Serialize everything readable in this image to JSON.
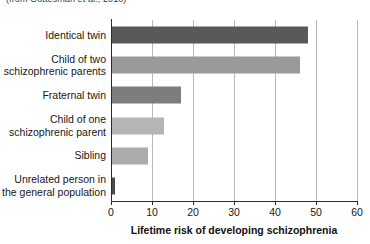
{
  "caption": {
    "source_note": "(from Gottesman et al., 2010)"
  },
  "chart_data": {
    "type": "bar",
    "orientation": "horizontal",
    "title": "",
    "xlabel": "Lifetime risk of developing schizophrenia",
    "ylabel": "",
    "categories": [
      "Identical twin",
      "Child of two schizophrenic parents",
      "Fraternal twin",
      "Child of one schizophrenic parent",
      "Sibling",
      "Unrelated person in the general population"
    ],
    "values": [
      48,
      46,
      17,
      13,
      9,
      1
    ],
    "bar_colors": [
      "#595959",
      "#9a9a9a",
      "#7d7d7d",
      "#b5b5b5",
      "#ababab",
      "#4a4a4a"
    ],
    "xlim": [
      0,
      60
    ],
    "xticks": [
      0,
      10,
      20,
      30,
      40,
      50,
      60
    ],
    "xticklabels": [
      "0",
      "10",
      "20",
      "30",
      "40",
      "50",
      "60"
    ],
    "grid": "vertical",
    "legend": "none"
  },
  "axis": {
    "title": "Lifetime risk of developing schizophrenia"
  },
  "colors": {
    "axis": "#2b2b2b",
    "gridline": "#b9b9b9",
    "text": "#171717",
    "background": "#ffffff"
  }
}
